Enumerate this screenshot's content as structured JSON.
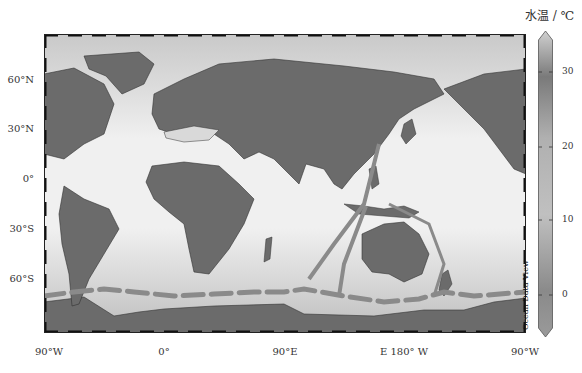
{
  "map": {
    "title": "World ocean water temperature map",
    "projection": "Equirectangular, centered 90°E",
    "lat_labels": [
      {
        "text": "60°N",
        "y": 80
      },
      {
        "text": "30°N",
        "y": 129
      },
      {
        "text": "0°",
        "y": 179
      },
      {
        "text": "30°S",
        "y": 229
      },
      {
        "text": "60°S",
        "y": 279
      }
    ],
    "lon_labels": [
      {
        "text": "90°W",
        "x": 49
      },
      {
        "text": "0°",
        "x": 164
      },
      {
        "text": "90°E",
        "x": 285
      },
      {
        "text": "E 180° W",
        "x": 404
      },
      {
        "text": "90°W",
        "x": 525
      }
    ],
    "colors": {
      "land": "#6b6b6b",
      "ocean_warm": "#ececec",
      "ocean_cold": "#b5b5b5",
      "track": "#8a8a8a",
      "frame": "#222222"
    }
  },
  "colorbar": {
    "title": "水温 / ℃",
    "ticks": [
      {
        "label": "30",
        "y": 72
      },
      {
        "label": "20",
        "y": 147
      },
      {
        "label": "10",
        "y": 220
      },
      {
        "label": "0",
        "y": 295
      }
    ],
    "range": [
      -5,
      35
    ]
  },
  "watermark": "Ocean Data View"
}
